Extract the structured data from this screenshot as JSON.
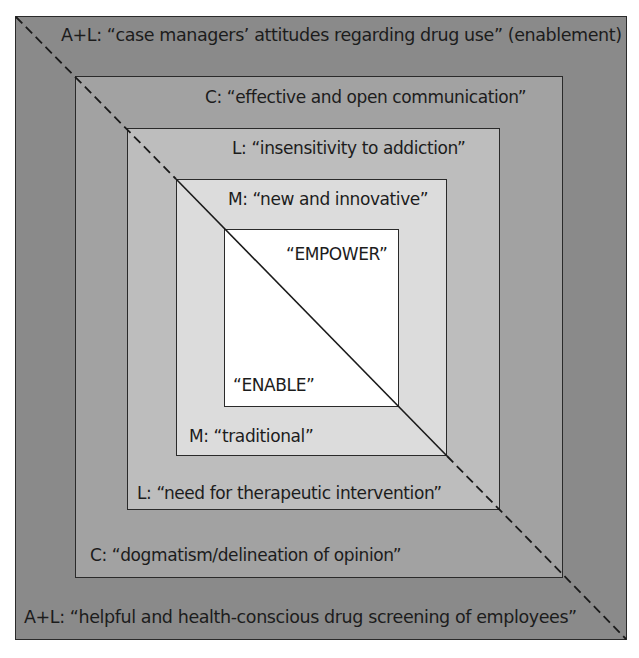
{
  "diagram": {
    "type": "nested-squares-with-diagonal",
    "colors": {
      "level1": "#8a8a8a",
      "level2": "#a2a2a2",
      "level3": "#bdbdbd",
      "level4": "#dcdcdc",
      "level5": "#ffffff",
      "line": "#1a1a1a"
    },
    "levels": [
      {
        "id": "outer",
        "top_label": "A+L: “case managers’ attitudes regarding drug use” (enablement)",
        "bottom_label": "A+L: “helpful and health-conscious drug screening of employees”"
      },
      {
        "id": "second",
        "top_label": "C:  “effective and open communication”",
        "bottom_label": "C:   “dogmatism/delineation of opinion”"
      },
      {
        "id": "third",
        "top_label": "L:  “insensitivity to addiction”",
        "bottom_label": "L:  “need for therapeutic intervention”"
      },
      {
        "id": "fourth",
        "top_label": "M: “new and innovative”",
        "bottom_label": "M:  “traditional”"
      },
      {
        "id": "center",
        "top_label": "“EMPOWER”",
        "bottom_label": "“ENABLE”"
      }
    ]
  }
}
